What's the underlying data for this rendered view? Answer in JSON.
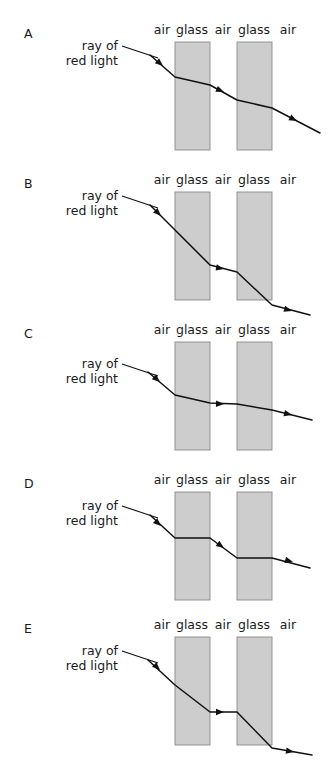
{
  "figure": {
    "type": "physics-diagram",
    "background_color": "#ffffff",
    "ray_color": "#111111",
    "glass_fill_color": "#cdcdcd",
    "glass_border_color": "#8a8a8a",
    "layout": {
      "panel_count": 5,
      "panel_height": 150,
      "slab1_x": [
        175,
        210
      ],
      "slab2_x": [
        237,
        272
      ],
      "label_row_offset": 10
    },
    "medium_labels": [
      "air",
      "glass",
      "air",
      "glass",
      "air"
    ],
    "medium_label_x": [
      162,
      192,
      223,
      254,
      288
    ],
    "ray_caption_line1": "ray of",
    "ray_caption_line2": "red light",
    "panels": [
      {
        "letter": "A",
        "letter_x": 24,
        "letter_y": 38,
        "caption_x": 118,
        "caption_y1": 50,
        "caption_y2": 65,
        "leader": "M122,46 L158,58",
        "label_y": 34,
        "slab_y": 42,
        "slab_height": 108,
        "ray": "M150,55 L175,77 L210,85 L237,100 L272,108 L320,133",
        "arrows": [
          {
            "x": 163,
            "y": 66,
            "angle": 41
          },
          {
            "x": 224,
            "y": 92,
            "angle": 23
          },
          {
            "x": 297,
            "y": 121,
            "angle": 27
          }
        ]
      },
      {
        "letter": "B",
        "letter_x": 24,
        "letter_y": 188,
        "caption_x": 118,
        "caption_y1": 200,
        "caption_y2": 215,
        "leader": "M122,196 L158,208",
        "label_y": 184,
        "slab_y": 192,
        "slab_height": 108,
        "ray": "M150,205 L175,230 L210,265 L237,272 L272,305 L310,315",
        "arrows": [
          {
            "x": 161,
            "y": 216,
            "angle": 45
          },
          {
            "x": 224,
            "y": 269,
            "angle": 11
          },
          {
            "x": 292,
            "y": 311,
            "angle": 16
          }
        ]
      },
      {
        "letter": "C",
        "letter_x": 24,
        "letter_y": 338,
        "caption_x": 118,
        "caption_y1": 368,
        "caption_y2": 383,
        "leader": "M122,364 L158,376",
        "label_y": 334,
        "slab_y": 342,
        "slab_height": 108,
        "ray": "M148,372 L175,395 L210,403 L237,404 L272,410 L312,420",
        "arrows": [
          {
            "x": 160,
            "y": 382,
            "angle": 41
          },
          {
            "x": 224,
            "y": 404,
            "angle": 2
          },
          {
            "x": 292,
            "y": 415,
            "angle": 14
          }
        ]
      },
      {
        "letter": "D",
        "letter_x": 24,
        "letter_y": 488,
        "caption_x": 118,
        "caption_y1": 510,
        "caption_y2": 525,
        "leader": "M122,506 L158,518",
        "label_y": 484,
        "slab_y": 492,
        "slab_height": 108,
        "ray": "M150,515 L175,538 L210,538 L237,558 L272,558 L310,568",
        "arrows": [
          {
            "x": 161,
            "y": 526,
            "angle": 43
          },
          {
            "x": 224,
            "y": 548,
            "angle": 36
          },
          {
            "x": 293,
            "y": 562,
            "angle": 15
          }
        ]
      },
      {
        "letter": "E",
        "letter_x": 24,
        "letter_y": 633,
        "caption_x": 118,
        "caption_y1": 655,
        "caption_y2": 670,
        "leader": "M122,651 L158,663",
        "label_y": 629,
        "slab_y": 637,
        "slab_height": 108,
        "ray": "M148,660 L175,685 L210,712 L237,712 L272,748 L312,755",
        "arrows": [
          {
            "x": 160,
            "y": 670,
            "angle": 44
          },
          {
            "x": 224,
            "y": 712,
            "angle": 0
          },
          {
            "x": 294,
            "y": 752,
            "angle": 10
          }
        ]
      }
    ]
  }
}
